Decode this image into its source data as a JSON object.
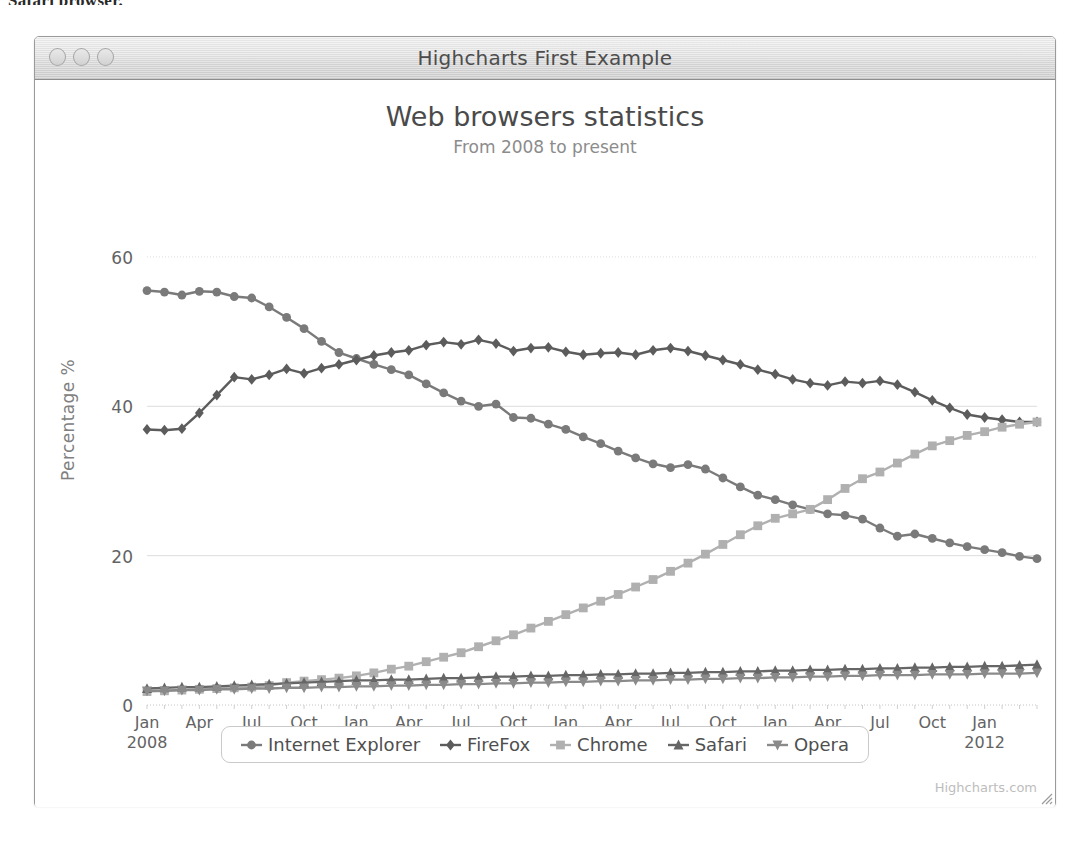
{
  "scan_artifact_text": "Safari browser.",
  "window": {
    "title": "Highcharts First Example",
    "controls": [
      {
        "name": "close-button",
        "label": ""
      },
      {
        "name": "minimize-button",
        "label": ""
      },
      {
        "name": "maximize-button",
        "label": ""
      }
    ]
  },
  "credits": "Highcharts.com",
  "colors": {
    "internet_explorer": "#7a7a7a",
    "firefox": "#5c5c5c",
    "chrome": "#b0b0b0",
    "safari": "#666666",
    "opera": "#8a8a8a",
    "gridline": "#dcdcdc",
    "axis_text": "#636363",
    "title_text": "#4a4a4a",
    "subtitle_text": "#8c8c8c"
  },
  "chart_data": {
    "type": "line",
    "title": "Web browsers statistics",
    "subtitle": "From 2008 to present",
    "xlabel": "",
    "ylabel": "Percentage %",
    "ylim": [
      0,
      62
    ],
    "yticks": [
      0,
      20,
      40,
      60
    ],
    "grid": true,
    "legend_position": "bottom",
    "x_tick_labels": [
      {
        "month": "Jan",
        "year": "2008"
      },
      {
        "month": "Apr",
        "year": ""
      },
      {
        "month": "Jul",
        "year": ""
      },
      {
        "month": "Oct",
        "year": ""
      },
      {
        "month": "Jan",
        "year": "2009"
      },
      {
        "month": "Apr",
        "year": ""
      },
      {
        "month": "Jul",
        "year": ""
      },
      {
        "month": "Oct",
        "year": ""
      },
      {
        "month": "Jan",
        "year": "2010"
      },
      {
        "month": "Apr",
        "year": ""
      },
      {
        "month": "Jul",
        "year": ""
      },
      {
        "month": "Oct",
        "year": ""
      },
      {
        "month": "Jan",
        "year": "2011"
      },
      {
        "month": "Apr",
        "year": ""
      },
      {
        "month": "Jul",
        "year": ""
      },
      {
        "month": "Oct",
        "year": ""
      },
      {
        "month": "Jan",
        "year": "2012"
      }
    ],
    "x_start": "2008-01",
    "x_end": "2012-02",
    "series": [
      {
        "name": "Internet Explorer",
        "marker": "circle",
        "color": "#7a7a7a",
        "values": [
          55.5,
          55.3,
          54.9,
          55.4,
          55.3,
          54.7,
          54.5,
          53.3,
          51.9,
          50.4,
          48.7,
          47.2,
          46.4,
          45.6,
          44.9,
          44.2,
          43.0,
          41.8,
          40.7,
          40.0,
          40.3,
          38.5,
          38.4,
          37.6,
          36.9,
          35.9,
          35.0,
          34.0,
          33.1,
          32.3,
          31.8,
          32.2,
          31.6,
          30.4,
          29.2,
          28.1,
          27.5,
          26.8,
          26.2,
          25.6,
          25.4,
          24.9,
          23.7,
          22.6,
          22.9,
          22.3,
          21.7,
          21.2,
          20.8,
          20.4,
          19.9,
          19.6
        ]
      },
      {
        "name": "FireFox",
        "marker": "diamond",
        "color": "#5c5c5c",
        "values": [
          36.9,
          36.8,
          37.0,
          39.1,
          41.5,
          43.9,
          43.6,
          44.2,
          45.0,
          44.4,
          45.1,
          45.6,
          46.2,
          46.8,
          47.2,
          47.5,
          48.2,
          48.6,
          48.3,
          48.9,
          48.4,
          47.4,
          47.8,
          47.9,
          47.3,
          46.9,
          47.1,
          47.2,
          46.9,
          47.5,
          47.8,
          47.4,
          46.8,
          46.2,
          45.6,
          44.9,
          44.3,
          43.6,
          43.1,
          42.8,
          43.3,
          43.1,
          43.4,
          42.9,
          41.9,
          40.8,
          39.8,
          38.9,
          38.5,
          38.2,
          37.9,
          37.9
        ]
      },
      {
        "name": "Chrome",
        "marker": "square",
        "color": "#b0b0b0",
        "values": [
          1.8,
          1.9,
          2.0,
          2.1,
          2.2,
          2.3,
          2.4,
          2.6,
          3.0,
          3.2,
          3.4,
          3.6,
          3.9,
          4.3,
          4.8,
          5.2,
          5.8,
          6.4,
          7.0,
          7.8,
          8.6,
          9.4,
          10.3,
          11.2,
          12.1,
          13.0,
          13.9,
          14.8,
          15.8,
          16.8,
          17.9,
          19.0,
          20.2,
          21.5,
          22.8,
          24.0,
          25.0,
          25.6,
          26.2,
          27.5,
          29.0,
          30.3,
          31.2,
          32.4,
          33.6,
          34.7,
          35.4,
          36.1,
          36.6,
          37.2,
          37.6,
          37.9
        ]
      },
      {
        "name": "Safari",
        "marker": "triangle",
        "color": "#666666",
        "values": [
          2.2,
          2.3,
          2.4,
          2.4,
          2.5,
          2.6,
          2.7,
          2.8,
          2.9,
          3.0,
          3.1,
          3.2,
          3.3,
          3.3,
          3.4,
          3.4,
          3.5,
          3.6,
          3.6,
          3.7,
          3.8,
          3.8,
          3.9,
          3.9,
          4.0,
          4.0,
          4.1,
          4.1,
          4.2,
          4.2,
          4.3,
          4.3,
          4.4,
          4.4,
          4.5,
          4.5,
          4.6,
          4.6,
          4.7,
          4.7,
          4.8,
          4.8,
          4.9,
          4.9,
          5.0,
          5.0,
          5.1,
          5.1,
          5.2,
          5.2,
          5.3,
          5.4
        ]
      },
      {
        "name": "Opera",
        "marker": "triangle-down",
        "color": "#8a8a8a",
        "values": [
          1.9,
          1.9,
          2.0,
          2.0,
          2.1,
          2.1,
          2.2,
          2.2,
          2.3,
          2.3,
          2.4,
          2.4,
          2.5,
          2.5,
          2.6,
          2.6,
          2.7,
          2.7,
          2.8,
          2.8,
          2.9,
          2.9,
          3.0,
          3.0,
          3.1,
          3.1,
          3.2,
          3.2,
          3.3,
          3.3,
          3.4,
          3.4,
          3.5,
          3.5,
          3.6,
          3.6,
          3.7,
          3.7,
          3.8,
          3.8,
          3.9,
          3.9,
          4.0,
          4.0,
          4.0,
          4.1,
          4.1,
          4.1,
          4.2,
          4.2,
          4.2,
          4.3
        ]
      }
    ]
  }
}
